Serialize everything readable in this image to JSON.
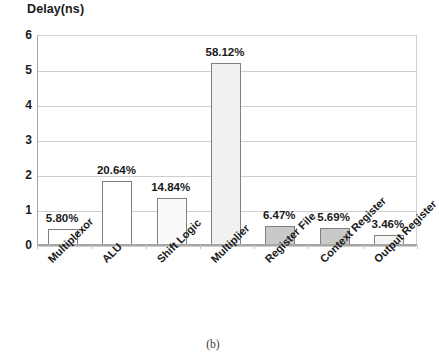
{
  "chart_data": {
    "type": "bar",
    "title": "Delay(ns)",
    "xlabel": "",
    "ylabel": "Delay(ns)",
    "ylim": [
      0,
      6
    ],
    "yticks": [
      0,
      1,
      2,
      3,
      4,
      5,
      6
    ],
    "grid": true,
    "legend": null,
    "categories": [
      "Multiplexor",
      "ALU",
      "Shift Logic",
      "Multiplier",
      "Register File",
      "Context Register",
      "Output Register"
    ],
    "values": [
      0.5,
      1.86,
      1.37,
      5.22,
      0.58,
      0.51,
      0.31
    ],
    "data_labels": [
      "5.80%",
      "20.64%",
      "14.84%",
      "58.12%",
      "6.47%",
      "5.69%",
      "3.46%"
    ],
    "bar_fills": [
      "#ffffff",
      "#ffffff",
      "#fafafa",
      "#f1f1f1",
      "#c9c9c9",
      "#c9c9c9",
      "#f4f4f4"
    ],
    "bar_border_color": "#808080",
    "gridline_color": "#cfcfcf",
    "axis_color": "#a6a6a6",
    "background": "#ffffff"
  },
  "caption": {
    "text": "(b)"
  }
}
